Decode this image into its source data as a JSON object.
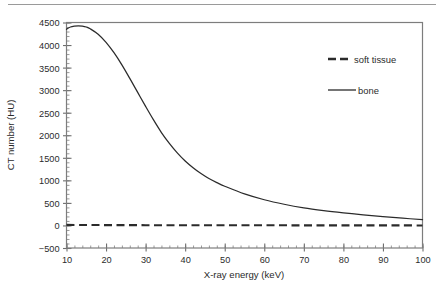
{
  "figure": {
    "name": "ct-number-vs-xray-energy-plot",
    "background": "#ffffff",
    "frame_color": "#7d7d7d",
    "text_color": "#2b2b2b"
  },
  "chart_data": {
    "type": "line",
    "title": "",
    "xlabel": "X-ray energy (keV)",
    "ylabel": "CT number (HU)",
    "xlim": [
      10,
      100
    ],
    "ylim": [
      -500,
      4500
    ],
    "xticks": [
      10,
      20,
      30,
      40,
      50,
      60,
      70,
      80,
      90,
      100
    ],
    "xtick_labels": [
      "10",
      "20",
      "30",
      "40",
      "50",
      "60",
      "70",
      "80",
      "90",
      "100"
    ],
    "yticks": [
      -500,
      0,
      500,
      1000,
      1500,
      2000,
      2500,
      3000,
      3500,
      4000,
      4500
    ],
    "ytick_labels": [
      "−500",
      "0",
      "500",
      "1000",
      "1500",
      "2000",
      "2500",
      "3000",
      "3500",
      "4000",
      "4500"
    ],
    "grid": false,
    "minor_ticks": {
      "x_step": 2,
      "y_step": 100
    },
    "legend": {
      "position": "upper-right-inside",
      "entries": [
        {
          "label": "soft tissue",
          "style": "dashed",
          "color": "#2b2b2b"
        },
        {
          "label": "bone",
          "style": "solid",
          "color": "#2b2b2b"
        }
      ]
    },
    "series": [
      {
        "name": "soft tissue",
        "style": "dashed",
        "color": "#2b2b2b",
        "x": [
          10,
          15,
          20,
          25,
          30,
          35,
          40,
          45,
          50,
          55,
          60,
          65,
          70,
          75,
          80,
          85,
          90,
          95,
          100
        ],
        "values": [
          12,
          10,
          8,
          7,
          6,
          5,
          5,
          4,
          4,
          3,
          3,
          3,
          2,
          2,
          2,
          2,
          1,
          1,
          0
        ]
      },
      {
        "name": "bone",
        "style": "solid",
        "color": "#2b2b2b",
        "x": [
          10,
          11,
          12,
          13,
          14,
          15,
          16,
          18,
          20,
          22,
          24,
          26,
          28,
          30,
          32,
          34,
          36,
          38,
          40,
          42,
          44,
          46,
          48,
          50,
          55,
          60,
          65,
          70,
          75,
          80,
          85,
          90,
          95,
          100
        ],
        "values": [
          4350,
          4400,
          4420,
          4425,
          4420,
          4400,
          4360,
          4240,
          4060,
          3830,
          3560,
          3260,
          2950,
          2640,
          2340,
          2060,
          1820,
          1610,
          1430,
          1280,
          1150,
          1040,
          950,
          870,
          700,
          570,
          470,
          390,
          330,
          280,
          235,
          195,
          160,
          130
        ]
      }
    ]
  }
}
